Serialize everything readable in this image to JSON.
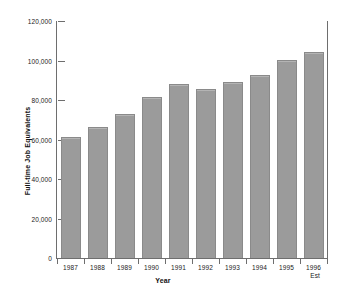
{
  "chart_data": {
    "type": "bar",
    "title": "",
    "xlabel": "Year",
    "ylabel": "Full-time Job Equivalents",
    "categories": [
      "1987",
      "1988",
      "1989",
      "1990",
      "1991",
      "1992",
      "1993",
      "1994",
      "1995",
      "1996"
    ],
    "category_sublabels": [
      "",
      "",
      "",
      "",
      "",
      "",
      "",
      "",
      "",
      "Est"
    ],
    "values": [
      61500,
      66500,
      73000,
      81500,
      88000,
      85500,
      89000,
      92500,
      100500,
      104500
    ],
    "ylim": [
      0,
      120000
    ],
    "ytick_values": [
      0,
      20000,
      40000,
      60000,
      80000,
      100000,
      120000
    ],
    "ytick_labels": [
      "0",
      "20,000",
      "40,000",
      "60,000",
      "80,000",
      "100,000",
      "120,000"
    ],
    "grid": false,
    "legend": false,
    "bar_color": "#9b9b9b",
    "bar_edge_color": "#8a8a8a",
    "axis_color": "#6e6e6e",
    "background_color": "#ffffff"
  }
}
